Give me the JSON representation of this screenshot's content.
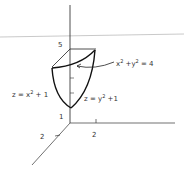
{
  "figure": {
    "title": "",
    "surfaces": {
      "cylinder_label_lhs": "x",
      "cylinder_label_mid": " +y",
      "cylinder_label_rhs": " = 4",
      "paraboloid_x_lhs": "z = x",
      "paraboloid_x_rhs": " + 1",
      "paraboloid_y_lhs": "z = y",
      "paraboloid_y_rhs": " +1",
      "exp": "2"
    },
    "axes": {
      "z_tick_top": "5",
      "z_tick_bottom": "1",
      "x_tick": "2",
      "y_tick": "2"
    },
    "colors": {
      "ink": "#1a1a1a",
      "guide": "#bbbbbb"
    }
  }
}
